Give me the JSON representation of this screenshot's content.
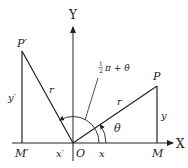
{
  "diagram": {
    "type": "coordinate-rotation",
    "axes": {
      "x_label": "X",
      "y_label": "Y",
      "origin_label": "O"
    },
    "points": {
      "P": {
        "label": "P"
      },
      "P_prime": {
        "label": "P′"
      },
      "M": {
        "label": "M"
      },
      "M_prime": {
        "label": "M′"
      }
    },
    "segments": {
      "r_right": "r",
      "r_left": "r",
      "y_right": "y",
      "y_left": "y′",
      "x_right": "x",
      "x_left": "x′"
    },
    "angles": {
      "theta": "θ",
      "rotated_num": "1",
      "rotated_den": "2",
      "rotated_rest": "π + θ"
    },
    "colors": {
      "stroke": "#222222",
      "background": "#ffffff"
    }
  }
}
